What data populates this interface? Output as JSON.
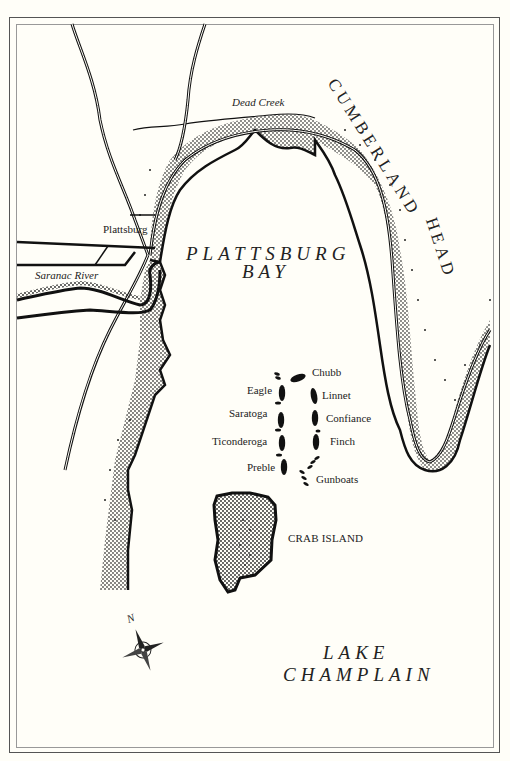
{
  "map": {
    "title_area": {
      "bay_line1": "PLATTSBURG",
      "bay_line2": "BAY"
    },
    "places": {
      "town": "Plattsburg",
      "river": "Saranac River",
      "creek": "Dead Creek",
      "headland_line1": "CUMBERLAND",
      "headland_line2": "HEAD",
      "island": "CRAB ISLAND",
      "lake_line1": "LAKE",
      "lake_line2": "CHAMPLAIN"
    },
    "american_fleet": [
      {
        "name": "Eagle"
      },
      {
        "name": "Saratoga"
      },
      {
        "name": "Ticonderoga"
      },
      {
        "name": "Preble"
      }
    ],
    "british_fleet": [
      {
        "name": "Chubb"
      },
      {
        "name": "Linnet"
      },
      {
        "name": "Confiance"
      },
      {
        "name": "Finch"
      },
      {
        "name": "Gunboats"
      }
    ],
    "compass": {
      "north_label": "N",
      "icon": "compass-rose-icon"
    },
    "colors": {
      "paper": "#fffef8",
      "ink": "#1a1a1a",
      "frame": "#555555"
    }
  }
}
